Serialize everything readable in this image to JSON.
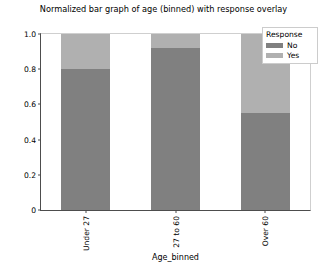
{
  "chart_data": {
    "type": "bar",
    "title": "Normalized bar graph of age (binned) with response overlay",
    "xlabel": "Age_binned",
    "ylabel": "",
    "categories": [
      "Under 27",
      "27 to 60",
      "Over 60"
    ],
    "series": [
      {
        "name": "No",
        "color": "#808080",
        "values": [
          0.8,
          0.92,
          0.55
        ]
      },
      {
        "name": "Yes",
        "color": "#b0b0b0",
        "values": [
          0.2,
          0.08,
          0.45
        ]
      }
    ],
    "stacked": true,
    "normalized": true,
    "ylim": [
      0,
      1.0
    ],
    "yticks": [
      "0",
      "0.2",
      "0.4",
      "0.6",
      "0.8",
      "1.0"
    ],
    "ytick_values": [
      0,
      0.2,
      0.4,
      0.6,
      0.8,
      1.0
    ],
    "grid": false,
    "legend": {
      "title": "Response",
      "position": "upper-right",
      "entries": [
        "No",
        "Yes"
      ]
    },
    "xtick_rotation": 90
  },
  "legend": {
    "title": "Response",
    "items": [
      {
        "label": "No",
        "color": "#808080"
      },
      {
        "label": "Yes",
        "color": "#b0b0b0"
      }
    ]
  },
  "axes": {
    "title": "Normalized bar graph of age (binned) with response overlay",
    "xlabel": "Age_binned",
    "yticks": [
      "0",
      "0.2",
      "0.4",
      "0.6",
      "0.8",
      "1.0"
    ],
    "xticks": [
      "Under 27",
      "27 to 60",
      "Over 60"
    ]
  }
}
